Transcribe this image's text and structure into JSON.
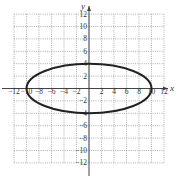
{
  "chart_data": {
    "type": "line",
    "title": "",
    "xlabel": "x",
    "ylabel": "y",
    "xlim": [
      -12,
      12
    ],
    "ylim": [
      -12,
      12
    ],
    "grid": true,
    "x_ticks": [
      -12,
      -10,
      -8,
      -6,
      -4,
      -2,
      2,
      4,
      6,
      8,
      10,
      12
    ],
    "y_ticks": [
      12,
      10,
      8,
      6,
      4,
      2,
      -2,
      -4,
      -6,
      -8,
      -10,
      -12
    ],
    "x_tick_labels": [
      "−12",
      "−10",
      "−8",
      "−6",
      "−4",
      "−2",
      "2",
      "4",
      "6",
      "8",
      "10",
      "12"
    ],
    "y_tick_labels": [
      "12",
      "10",
      "8",
      "6",
      "4",
      "2",
      "−2",
      "−4",
      "−6",
      "−8",
      "−10",
      "−12"
    ],
    "series": [
      {
        "name": "ellipse",
        "shape": "ellipse",
        "center": [
          0,
          0
        ],
        "semi_major_x": 10,
        "semi_minor_y": 4,
        "equation": "x^2/100 + y^2/16 = 1"
      }
    ]
  },
  "colors": {
    "curve": "#222222",
    "axis": "#444444",
    "grid": "#9a9a9a",
    "text": "#333333"
  }
}
